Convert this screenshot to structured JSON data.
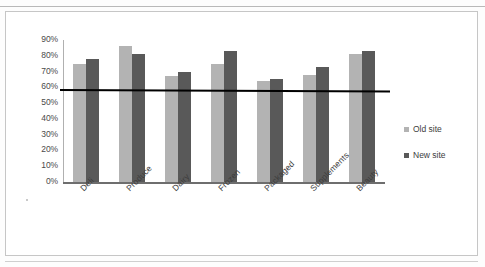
{
  "chart_data": {
    "type": "bar",
    "title": "",
    "subtitle": "",
    "xlabel": "",
    "ylabel": "",
    "ylim": [
      0,
      90
    ],
    "grid": false,
    "legend_position": "right",
    "categories": [
      "Deli",
      "Produce",
      "Dairy",
      "Frozen",
      "Packaged",
      "Supplements",
      "Beauty"
    ],
    "ytick_labels": [
      "90%",
      "80%",
      "70%",
      "60%",
      "50%",
      "40%",
      "30%",
      "20%",
      "10%",
      "0%"
    ],
    "ytick_values": [
      90,
      80,
      70,
      60,
      50,
      40,
      30,
      20,
      10,
      0
    ],
    "series": [
      {
        "name": "Old site",
        "color": "#b3b3b3",
        "values": [
          75,
          86,
          67,
          75,
          64,
          68,
          81
        ]
      },
      {
        "name": "New site",
        "color": "#595959",
        "values": [
          78,
          81,
          70,
          83,
          65,
          73,
          83
        ]
      }
    ],
    "annotations": [
      {
        "type": "threshold-line",
        "label": "",
        "value": 59,
        "color": "#000000"
      }
    ]
  },
  "legend": {
    "items": [
      {
        "label": "Old site",
        "color": "#b3b3b3"
      },
      {
        "label": "New site",
        "color": "#595959"
      }
    ]
  },
  "header": {
    "ghost_text": ""
  }
}
